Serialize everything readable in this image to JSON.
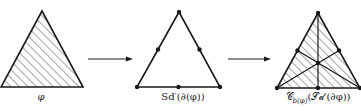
{
  "diagram": {
    "colors": {
      "stroke": "#1a1a1a",
      "background": "#ffffff"
    },
    "panels": [
      {
        "id": "simplex",
        "label": "φ",
        "description": "hatched (filled) 2-simplex"
      },
      {
        "id": "subdivided-boundary",
        "label": "Sd′(∂(φ))",
        "description": "boundary of triangle with vertices and edge midpoints marked"
      },
      {
        "id": "cone",
        "label": "𝒞b(φ)(𝒮𝒹′(∂φ))",
        "label_parts": {
          "main": "𝒞",
          "sub": "b(φ)",
          "arg": "(𝒮𝒹′(∂φ))"
        },
        "description": "cone from barycenter over subdivided boundary, hatched"
      }
    ],
    "arrows": [
      {
        "from": "simplex",
        "to": "subdivided-boundary"
      },
      {
        "from": "subdivided-boundary",
        "to": "cone"
      }
    ]
  }
}
